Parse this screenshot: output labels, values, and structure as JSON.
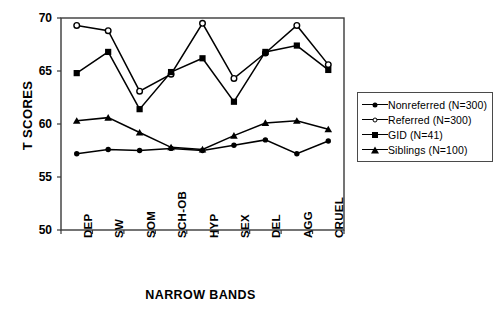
{
  "chart_data": {
    "type": "line",
    "title": "",
    "xlabel": "NARROW BANDS",
    "ylabel": "T SCORES",
    "categories": [
      "DEP",
      "SW",
      "SOM",
      "SCH-OB",
      "HYP",
      "SEX",
      "DEL",
      "AGG",
      "CRUEL"
    ],
    "ylim": [
      50,
      70
    ],
    "yticks": [
      70,
      65,
      60,
      55,
      50
    ],
    "grid": false,
    "legend_position": "right",
    "series": [
      {
        "name": "Nonreferred (N=300)",
        "marker": "filled-circle",
        "values": [
          57.2,
          57.6,
          57.5,
          57.7,
          57.5,
          58.0,
          58.5,
          57.2,
          58.4
        ]
      },
      {
        "name": "Referred (N=300)",
        "marker": "open-circle",
        "values": [
          69.3,
          68.8,
          63.1,
          64.7,
          69.5,
          64.3,
          66.7,
          69.3,
          65.6
        ]
      },
      {
        "name": "GID (N=41)",
        "marker": "filled-square",
        "values": [
          64.8,
          66.8,
          61.4,
          64.9,
          66.2,
          62.1,
          66.8,
          67.4,
          65.1
        ]
      },
      {
        "name": "Siblings (N=100)",
        "marker": "filled-triangle",
        "values": [
          60.3,
          60.6,
          59.2,
          57.8,
          57.6,
          58.9,
          60.1,
          60.3,
          59.5
        ]
      }
    ]
  },
  "legend": {
    "items": [
      {
        "label": "Nonreferred (N=300)",
        "marker": "filled-circle"
      },
      {
        "label": "Referred (N=300)",
        "marker": "open-circle"
      },
      {
        "label": "GID (N=41)",
        "marker": "filled-square"
      },
      {
        "label": "Siblings  (N=100)",
        "marker": "filled-triangle"
      }
    ]
  },
  "colors": {
    "line": "#000000",
    "axis": "#3a3a3a",
    "background": "#ffffff"
  }
}
